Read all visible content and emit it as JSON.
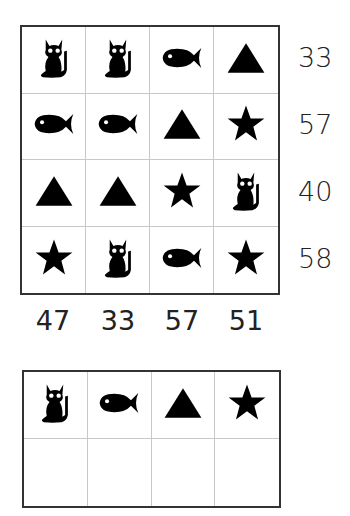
{
  "puzzle": {
    "grid": [
      [
        "cat",
        "cat",
        "fish",
        "triangle"
      ],
      [
        "fish",
        "fish",
        "triangle",
        "star"
      ],
      [
        "triangle",
        "triangle",
        "star",
        "cat"
      ],
      [
        "star",
        "cat",
        "fish",
        "star"
      ]
    ],
    "row_sums": [
      "33",
      "57",
      "40",
      "58"
    ],
    "col_sums": [
      "47",
      "33",
      "57",
      "51"
    ]
  },
  "answer_key": {
    "symbols": [
      "cat",
      "fish",
      "triangle",
      "star"
    ],
    "values": [
      "",
      "",
      "",
      ""
    ]
  },
  "colors": {
    "symbol": "#000000",
    "border": "#333333",
    "divider": "#c8c8c8"
  }
}
